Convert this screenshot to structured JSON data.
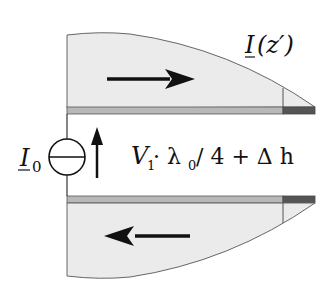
{
  "diagram": {
    "type": "dipole-current-distribution",
    "labels": {
      "current_distribution": "I(z′)",
      "current_distribution_symbol": "I",
      "current_distribution_arg": "(z′)",
      "source": "I",
      "source_subscript": "0",
      "length_expr_v": "V",
      "length_expr_v_sub": "1",
      "length_expr_mid": " · λ",
      "length_expr_lambda_sub": "0",
      "length_expr_tail": "/ 4 + Δ h"
    },
    "arrows": {
      "upper": "right",
      "lower": "left",
      "source": "up"
    },
    "colors": {
      "fill": "#ebebeb",
      "conductor": "#b8b8b8",
      "conductor_end": "#555555",
      "stroke": "#555555",
      "ink": "#111111"
    }
  }
}
